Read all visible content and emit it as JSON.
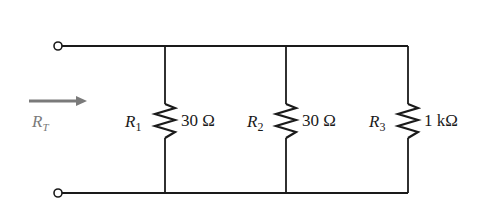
{
  "diagram": {
    "type": "parallel-resistor-circuit",
    "total_resistance_label": {
      "main": "R",
      "sub": "T"
    },
    "resistors": [
      {
        "name_main": "R",
        "name_sub": "1",
        "value": "30 Ω"
      },
      {
        "name_main": "R",
        "name_sub": "2",
        "value": "30 Ω"
      },
      {
        "name_main": "R",
        "name_sub": "3",
        "value": "1 kΩ"
      }
    ],
    "colors": {
      "wire": "#1a1a1a",
      "arrow": "#7a7a7a",
      "background": "#ffffff"
    }
  }
}
